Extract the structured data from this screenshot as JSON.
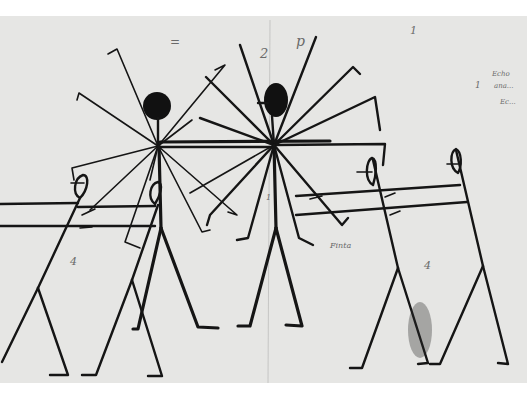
{
  "image": {
    "subject": "Ink sketch of stick figures with radiating limbs",
    "background": "#ffffff",
    "paper_color": "#e6e6e4",
    "ink_color": "#151515"
  },
  "annotations": {
    "label_2": "2",
    "label_top_right_1": "1",
    "label_left_4": "4",
    "label_right_4": "4",
    "label_center_small": "1",
    "note_mid": "Finta",
    "note_right_line1": "Echo",
    "note_right_line2": "ana...",
    "note_right_line3": "Ec...",
    "note_right_marker": "1",
    "note_top_center": "p",
    "note_scribble_top": "="
  }
}
